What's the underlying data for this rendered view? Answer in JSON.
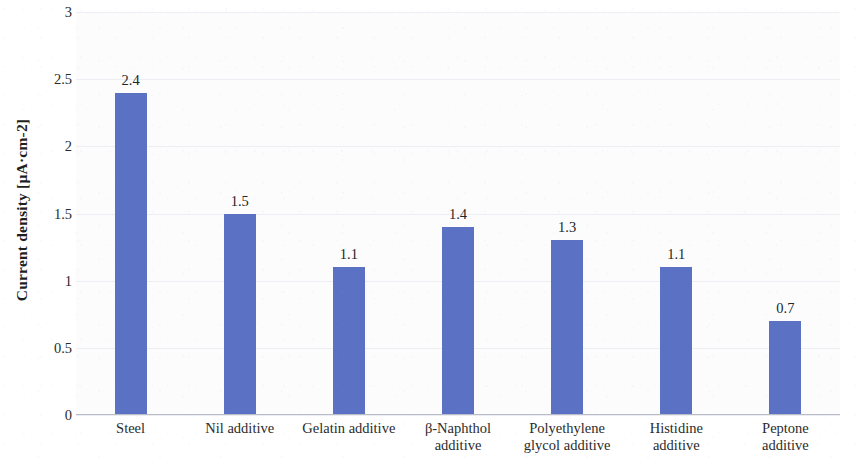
{
  "chart_data": {
    "type": "bar",
    "title": "",
    "xlabel": "",
    "ylabel": "Current density [µA·cm-2]",
    "categories": [
      "Steel",
      "Nil additive",
      "Gelatin additive",
      "β-Naphthol additive",
      "Polyethylene glycol additive",
      "Histidine additive",
      "Peptone additive"
    ],
    "category_lines": [
      [
        "Steel"
      ],
      [
        "Nil additive"
      ],
      [
        "Gelatin additive"
      ],
      [
        "β-Naphthol",
        "additive"
      ],
      [
        "Polyethylene",
        "glycol additive"
      ],
      [
        "Histidine",
        "additive"
      ],
      [
        "Peptone",
        "additive"
      ]
    ],
    "values": [
      2.4,
      1.5,
      1.1,
      1.4,
      1.3,
      1.1,
      0.7
    ],
    "value_labels": [
      "2.4",
      "1.5",
      "1.1",
      "1.4",
      "1.3",
      "1.1",
      "0.7"
    ],
    "ylim": [
      0,
      3
    ],
    "ytick_values": [
      0,
      0.5,
      1,
      1.5,
      2,
      2.5,
      3
    ],
    "ytick_labels": [
      "0",
      "0.5",
      "1",
      "1.5",
      "2",
      "2.5",
      "3"
    ],
    "grid": true,
    "legend": false,
    "bar_color": "#5b72c4",
    "plot_background": "#fcfcfd",
    "text_color": "#2b2b2b"
  }
}
